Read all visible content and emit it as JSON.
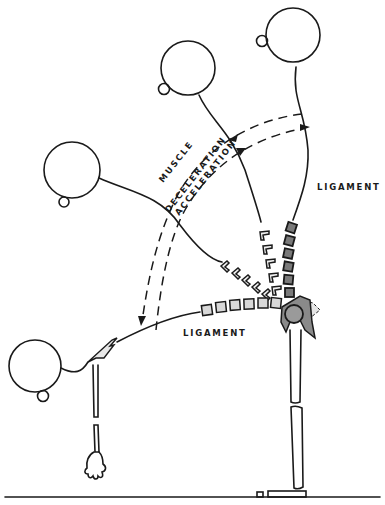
{
  "diagram": {
    "title": "",
    "labels": {
      "ligament_upper": "LIGAMENT",
      "ligament_lower": "LIGAMENT",
      "muscle": "MUSCLE",
      "deceleration": "DECELERATION",
      "acceleration": "ACCELERATION"
    },
    "figure": {
      "positions": [
        "upright-back",
        "upright",
        "forward-45",
        "forward-bent"
      ],
      "parts": [
        "head",
        "neck-spine",
        "hip-joint",
        "leg",
        "arm",
        "hand",
        "foot",
        "ground"
      ]
    },
    "colors": {
      "ink": "#1a1a1a",
      "light_segment": "#d8d8d8",
      "dark_segment": "#7a7a7a",
      "joint": "#8a8a8a"
    }
  }
}
